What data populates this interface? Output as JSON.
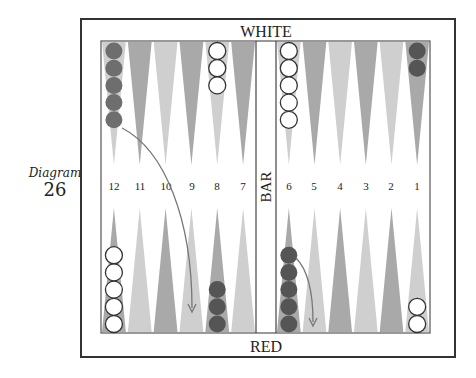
{
  "caption": {
    "word": "Diagram",
    "number": "26"
  },
  "board": {
    "top_label": "WHITE",
    "bottom_label": "RED",
    "bar_label": "BAR",
    "point_numbers_left": [
      "12",
      "11",
      "10",
      "9",
      "8",
      "7"
    ],
    "point_numbers_right": [
      "6",
      "5",
      "4",
      "3",
      "2",
      "1"
    ]
  },
  "colors": {
    "frame": "#333333",
    "point_dark": "#a9a9a9",
    "point_light": "#cfcfcf",
    "red_checker": "#6e6e6e",
    "red_checker_dark": "#555555",
    "white_checker": "#ffffff",
    "arrow": "#777777"
  },
  "checkers": {
    "top": [
      {
        "point": "12",
        "color": "red",
        "count": 5
      },
      {
        "point": "8",
        "color": "white",
        "count": 3
      },
      {
        "point": "6",
        "color": "white",
        "count": 5
      },
      {
        "point": "1",
        "color": "red",
        "count": 2
      }
    ],
    "bottom": [
      {
        "point": "12",
        "color": "white",
        "count": 5
      },
      {
        "point": "8",
        "color": "red",
        "count": 3
      },
      {
        "point": "6",
        "color": "red",
        "count": 5
      },
      {
        "point": "1",
        "color": "white",
        "count": 2
      }
    ]
  },
  "moves": [
    {
      "from": "top 12",
      "to": "bottom 9"
    },
    {
      "from": "bottom 6",
      "to": "bottom 5"
    }
  ]
}
